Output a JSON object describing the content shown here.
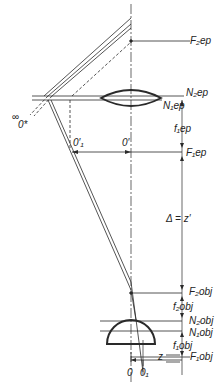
{
  "diagram": {
    "type": "optical ray diagram (microscope objective and eyepiece)",
    "labels": {
      "f2ep": "F₂ep",
      "n2ep": "N₂ep",
      "n1ep": "N₁ep",
      "f1ep_len": "f₁ep",
      "f1ep": "F₁ep",
      "infinity_o": "∞",
      "o_star": "0*",
      "o1_prime": "0′₁",
      "o_prime": "0′",
      "delta": "Δ = z′",
      "f2obj": "F₂obj",
      "f2obj_len": "f₂obj",
      "n2obj": "N₂obj",
      "n1obj": "N₁obj",
      "f1obj_len": "f₁obj",
      "z": "z",
      "f1obj": "F₁obj",
      "o": "0",
      "o1": "0₁"
    },
    "colors": {
      "line": "#2a2a2a",
      "background": "#ffffff"
    }
  }
}
